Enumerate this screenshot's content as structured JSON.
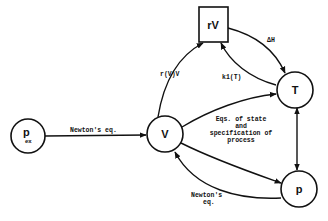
{
  "diagram": {
    "nodes": {
      "p_ex": {
        "label": "p",
        "subscript": "ex",
        "shape": "circle"
      },
      "V": {
        "label": "V",
        "shape": "circle"
      },
      "rV": {
        "label": "rV",
        "shape": "square"
      },
      "T": {
        "label": "T",
        "shape": "circle"
      },
      "p": {
        "label": "p",
        "shape": "circle"
      }
    },
    "edges": {
      "pex_to_V": {
        "from": "p_ex",
        "to": "V",
        "label": "Newton's eq."
      },
      "V_to_rV": {
        "from": "V",
        "to": "rV",
        "label": "r(V)V"
      },
      "rV_to_T": {
        "from": "rV",
        "to": "T",
        "label": "ΔH"
      },
      "T_to_rV": {
        "from": "T",
        "to": "rV",
        "label": "k1(T)"
      },
      "V_to_T": {
        "from": "V",
        "to": "T",
        "label": ""
      },
      "V_to_p": {
        "from": "V",
        "to": "p",
        "label": ""
      },
      "T_to_p": {
        "from": "T",
        "to": "p",
        "label": ""
      },
      "p_to_V": {
        "from": "p",
        "to": "V",
        "label_line1": "Newton's",
        "label_line2": "eq."
      }
    },
    "annotation": {
      "line1": "Eqs. of state",
      "line2": "and",
      "line3": "specification of",
      "line4": "process"
    },
    "colors": {
      "ink": "#111111",
      "background": "#ffffff"
    }
  }
}
